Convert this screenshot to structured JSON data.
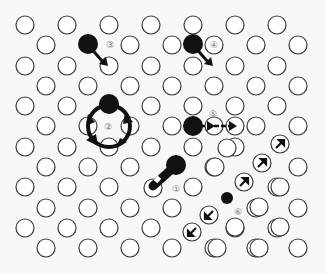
{
  "figure": {
    "colors": {
      "lattice_atom_stroke": "#3a3a3a",
      "diffusing_atom": "#111111",
      "background": "#f7f7f5",
      "label": "#777777"
    },
    "lattice": {
      "rows_y": [
        25,
        45,
        66,
        86,
        106,
        126,
        147,
        167,
        187,
        208,
        228,
        248
      ],
      "even_row_x": [
        25,
        67,
        109,
        151,
        193,
        235,
        277
      ],
      "odd_row_x": [
        46,
        88,
        130,
        172,
        214,
        256,
        298
      ],
      "atom_radius": 9
    },
    "mechanisms": [
      {
        "id": "1",
        "label": "①",
        "name": "vacancy-exchange",
        "atom": [
          175,
          166
        ],
        "label_pos": [
          176,
          190
        ]
      },
      {
        "id": "2",
        "label": "②",
        "name": "ring-rotation",
        "atom": [
          109,
          104
        ],
        "ring_center": [
          109,
          126
        ],
        "label_pos": [
          109,
          129
        ]
      },
      {
        "id": "3",
        "label": "③",
        "name": "interstitial-jump",
        "atom": [
          88,
          45
        ],
        "label_pos": [
          106,
          48
        ]
      },
      {
        "id": "4",
        "label": "④",
        "name": "interstitial-jump",
        "atom": [
          193,
          45
        ],
        "label_pos": [
          213,
          48
        ]
      },
      {
        "id": "5",
        "label": "⑤",
        "name": "crowdion",
        "atom": [
          193,
          126
        ],
        "label_pos": [
          214,
          113
        ]
      },
      {
        "id": "6",
        "label": "⑥",
        "name": "dislocation-path",
        "atom": [
          227,
          198
        ],
        "label_pos": [
          239,
          213
        ]
      }
    ],
    "labels": [
      "①",
      "②",
      "③",
      "④",
      "⑤",
      "⑥"
    ]
  }
}
